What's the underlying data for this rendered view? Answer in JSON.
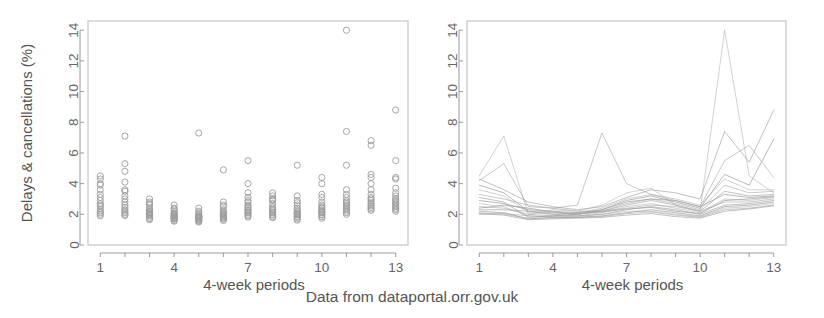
{
  "figure": {
    "caption": "Data from dataportal.orr.gov.uk",
    "width": 824,
    "height": 318,
    "background": "#ffffff",
    "ink_color": "#9d9d9d",
    "text_color": "#555555"
  },
  "chart_data": [
    {
      "id": "left-panel",
      "type": "scatter",
      "title": "",
      "xlabel": "4-week periods",
      "ylabel": "Delays & cancellations (%)",
      "xlim": [
        0.5,
        13.5
      ],
      "ylim": [
        0,
        14.6
      ],
      "xticks": [
        1,
        2,
        3,
        4,
        5,
        6,
        7,
        8,
        9,
        10,
        11,
        12,
        13
      ],
      "xtick_labels": [
        "1",
        "",
        "",
        "4",
        "",
        "",
        "7",
        "",
        "",
        "10",
        "",
        "",
        "13"
      ],
      "yticks": [
        0,
        2,
        4,
        6,
        8,
        10,
        12,
        14
      ],
      "ytick_labels": [
        "0",
        "2",
        "4",
        "6",
        "8",
        "10",
        "12",
        "14"
      ],
      "grid": false,
      "legend": "none",
      "marker": "open-circle",
      "series": [
        {
          "name": "operator-01",
          "x": [
            1,
            2,
            3,
            4,
            5,
            6,
            7,
            8,
            9,
            10,
            11,
            12,
            13
          ],
          "values": [
            4.5,
            4.8,
            2.8,
            2.4,
            2.2,
            2.6,
            3.4,
            3.2,
            2.9,
            3.1,
            3.6,
            4.4,
            4.3
          ]
        },
        {
          "name": "operator-02",
          "x": [
            1,
            2,
            3,
            4,
            5,
            6,
            7,
            8,
            9,
            10,
            11,
            12,
            13
          ],
          "values": [
            4.0,
            7.1,
            2.6,
            2.2,
            2.0,
            2.3,
            2.9,
            2.9,
            2.6,
            2.8,
            3.3,
            4.0,
            3.7
          ]
        },
        {
          "name": "operator-03",
          "x": [
            1,
            2,
            3,
            4,
            5,
            6,
            7,
            8,
            9,
            10,
            11,
            12,
            13
          ],
          "values": [
            3.6,
            3.5,
            2.4,
            2.1,
            1.9,
            2.2,
            2.8,
            2.7,
            2.4,
            2.6,
            3.1,
            3.6,
            3.4
          ]
        },
        {
          "name": "operator-04",
          "x": [
            1,
            2,
            3,
            4,
            5,
            6,
            7,
            8,
            9,
            10,
            11,
            12,
            13
          ],
          "values": [
            3.3,
            3.2,
            2.3,
            2.0,
            1.9,
            2.1,
            2.6,
            2.5,
            2.3,
            2.5,
            2.9,
            3.3,
            3.2
          ]
        },
        {
          "name": "operator-05",
          "x": [
            1,
            2,
            3,
            4,
            5,
            6,
            7,
            8,
            9,
            10,
            11,
            12,
            13
          ],
          "values": [
            3.1,
            3.0,
            2.2,
            1.95,
            1.85,
            2.05,
            2.5,
            2.4,
            2.2,
            2.4,
            2.8,
            3.1,
            3.0
          ]
        },
        {
          "name": "operator-06",
          "x": [
            1,
            2,
            3,
            4,
            5,
            6,
            7,
            8,
            9,
            10,
            11,
            12,
            13
          ],
          "values": [
            2.9,
            2.8,
            2.1,
            1.9,
            1.8,
            2.0,
            2.4,
            2.3,
            2.1,
            2.3,
            2.7,
            3.0,
            2.9
          ]
        },
        {
          "name": "operator-07",
          "x": [
            1,
            2,
            3,
            4,
            5,
            6,
            7,
            8,
            9,
            10,
            11,
            12,
            13
          ],
          "values": [
            2.7,
            2.6,
            2.05,
            1.85,
            1.8,
            1.95,
            2.3,
            2.25,
            2.05,
            2.2,
            2.6,
            2.9,
            2.8
          ]
        },
        {
          "name": "operator-08",
          "x": [
            1,
            2,
            3,
            4,
            5,
            6,
            7,
            8,
            9,
            10,
            11,
            12,
            13
          ],
          "values": [
            2.5,
            2.45,
            2.0,
            1.8,
            1.75,
            1.9,
            2.25,
            2.15,
            2.0,
            2.15,
            2.5,
            2.75,
            2.7
          ]
        },
        {
          "name": "operator-09",
          "x": [
            1,
            2,
            3,
            4,
            5,
            6,
            7,
            8,
            9,
            10,
            11,
            12,
            13
          ],
          "values": [
            2.35,
            2.3,
            1.95,
            1.78,
            1.7,
            1.85,
            2.15,
            2.1,
            1.95,
            2.1,
            2.4,
            2.65,
            2.6
          ]
        },
        {
          "name": "operator-10",
          "x": [
            1,
            2,
            3,
            4,
            5,
            6,
            7,
            8,
            9,
            10,
            11,
            12,
            13
          ],
          "values": [
            2.2,
            2.2,
            1.9,
            1.72,
            1.65,
            1.8,
            2.1,
            2.0,
            1.85,
            2.0,
            2.3,
            2.55,
            2.5
          ]
        },
        {
          "name": "operator-11",
          "x": [
            1,
            2,
            3,
            4,
            5,
            6,
            7,
            8,
            9,
            10,
            11,
            12,
            13
          ],
          "values": [
            2.1,
            2.1,
            1.8,
            1.68,
            1.6,
            1.75,
            2.0,
            1.95,
            1.8,
            1.95,
            2.2,
            2.45,
            2.4
          ]
        },
        {
          "name": "operator-12",
          "x": [
            1,
            2,
            3,
            4,
            5,
            6,
            7,
            8,
            9,
            10,
            11,
            12,
            13
          ],
          "values": [
            2.0,
            2.0,
            1.72,
            1.6,
            1.55,
            1.68,
            1.9,
            1.85,
            1.7,
            1.85,
            2.1,
            2.35,
            2.3
          ]
        },
        {
          "name": "operator-13",
          "x": [
            1,
            2,
            3,
            4,
            5,
            6,
            7,
            8,
            9,
            10,
            11,
            12,
            13
          ],
          "values": [
            1.9,
            1.92,
            1.65,
            1.55,
            1.5,
            1.6,
            1.82,
            1.78,
            1.62,
            1.75,
            2.0,
            2.25,
            2.2
          ]
        },
        {
          "name": "operator-14",
          "x": [
            1,
            2,
            3,
            4,
            5,
            6,
            7,
            8,
            9,
            10,
            11,
            12,
            13
          ],
          "values": [
            2.6,
            5.3,
            2.15,
            2.05,
            2.1,
            2.8,
            5.5,
            3.0,
            5.2,
            4.4,
            7.4,
            6.8,
            8.8
          ]
        },
        {
          "name": "operator-15",
          "x": [
            1,
            2,
            3,
            4,
            5,
            6,
            7,
            8,
            9,
            10,
            11,
            12,
            13
          ],
          "values": [
            4.3,
            4.1,
            3.0,
            2.6,
            2.4,
            2.5,
            4.0,
            3.4,
            3.2,
            4.0,
            5.2,
            6.5,
            5.5
          ]
        },
        {
          "name": "operator-16",
          "x": [
            1,
            2,
            3,
            4,
            5,
            6,
            7,
            8,
            9,
            10,
            11,
            12,
            13
          ],
          "values": [
            3.9,
            3.6,
            2.7,
            2.35,
            7.3,
            4.9,
            3.1,
            2.95,
            2.75,
            3.3,
            14.0,
            4.6,
            4.4
          ]
        }
      ]
    },
    {
      "id": "right-panel",
      "type": "line",
      "title": "",
      "xlabel": "4-week periods",
      "ylabel": "",
      "xlim": [
        0.5,
        13.5
      ],
      "ylim": [
        0,
        14.6
      ],
      "xticks": [
        1,
        2,
        3,
        4,
        5,
        6,
        7,
        8,
        9,
        10,
        11,
        12,
        13
      ],
      "xtick_labels": [
        "1",
        "",
        "",
        "4",
        "",
        "",
        "7",
        "",
        "",
        "10",
        "",
        "",
        "13"
      ],
      "yticks": [
        0,
        2,
        4,
        6,
        8,
        10,
        12,
        14
      ],
      "ytick_labels": [
        "0",
        "2",
        "4",
        "6",
        "8",
        "10",
        "12",
        "14"
      ],
      "grid": false,
      "legend": "none",
      "x": [
        1,
        2,
        3,
        4,
        5,
        6,
        7,
        8,
        9,
        10,
        11,
        12,
        13
      ],
      "series": [
        {
          "name": "toc-01",
          "values": [
            4.5,
            7.1,
            2.0,
            2.3,
            2.2,
            2.6,
            3.4,
            3.7,
            2.6,
            2.2,
            14.0,
            4.5,
            3.4
          ]
        },
        {
          "name": "toc-02",
          "values": [
            4.2,
            5.3,
            2.5,
            2.4,
            2.6,
            7.3,
            4.0,
            3.3,
            2.9,
            2.5,
            5.5,
            6.5,
            4.4
          ]
        },
        {
          "name": "toc-03",
          "values": [
            4.3,
            3.6,
            2.8,
            2.5,
            2.3,
            2.5,
            3.1,
            3.6,
            3.4,
            3.0,
            7.4,
            5.4,
            8.8
          ]
        },
        {
          "name": "toc-04",
          "values": [
            3.9,
            3.4,
            2.2,
            2.1,
            2.0,
            2.3,
            2.9,
            3.2,
            2.8,
            2.4,
            4.6,
            3.9,
            6.9
          ]
        },
        {
          "name": "toc-05",
          "values": [
            3.6,
            3.2,
            2.1,
            2.0,
            2.1,
            2.4,
            3.0,
            3.3,
            3.0,
            2.6,
            4.3,
            3.6,
            3.6
          ]
        },
        {
          "name": "toc-06",
          "values": [
            3.3,
            3.0,
            2.6,
            2.4,
            2.2,
            2.2,
            2.7,
            3.0,
            2.7,
            2.3,
            3.9,
            3.4,
            3.5
          ]
        },
        {
          "name": "toc-07",
          "values": [
            3.1,
            2.8,
            1.8,
            1.9,
            2.0,
            2.2,
            2.6,
            2.9,
            2.6,
            2.2,
            3.5,
            3.2,
            3.3
          ]
        },
        {
          "name": "toc-08",
          "values": [
            2.9,
            2.7,
            2.3,
            2.2,
            2.1,
            2.3,
            2.8,
            3.0,
            2.9,
            2.5,
            3.3,
            3.1,
            3.2
          ]
        },
        {
          "name": "toc-09",
          "values": [
            2.7,
            2.5,
            1.9,
            1.8,
            1.9,
            2.1,
            2.5,
            2.7,
            2.4,
            2.1,
            3.0,
            2.9,
            3.1
          ]
        },
        {
          "name": "toc-10",
          "values": [
            2.5,
            2.4,
            2.0,
            1.9,
            2.0,
            2.2,
            2.4,
            2.6,
            2.5,
            2.2,
            2.8,
            2.8,
            3.0
          ]
        },
        {
          "name": "toc-11",
          "values": [
            2.3,
            2.3,
            2.2,
            2.0,
            1.9,
            2.0,
            2.3,
            2.5,
            2.3,
            2.0,
            2.6,
            2.7,
            2.9
          ]
        },
        {
          "name": "toc-12",
          "values": [
            2.2,
            2.1,
            1.7,
            1.8,
            1.8,
            1.9,
            2.1,
            2.3,
            2.1,
            1.9,
            2.5,
            2.6,
            2.8
          ]
        },
        {
          "name": "toc-13",
          "values": [
            2.1,
            2.0,
            1.75,
            1.75,
            1.85,
            2.0,
            2.2,
            2.2,
            2.0,
            1.85,
            2.4,
            2.5,
            2.7
          ]
        },
        {
          "name": "toc-14",
          "values": [
            2.0,
            2.05,
            1.9,
            1.85,
            1.8,
            1.85,
            2.05,
            2.15,
            1.95,
            1.8,
            2.3,
            2.4,
            2.6
          ]
        },
        {
          "name": "toc-15",
          "values": [
            2.05,
            1.95,
            1.65,
            1.7,
            1.75,
            1.8,
            1.95,
            2.05,
            1.85,
            1.75,
            2.2,
            2.35,
            2.55
          ]
        },
        {
          "name": "toc-16",
          "values": [
            2.4,
            2.6,
            2.4,
            2.15,
            2.05,
            2.15,
            2.35,
            2.45,
            2.2,
            2.05,
            2.9,
            3.0,
            3.15
          ]
        }
      ]
    }
  ]
}
